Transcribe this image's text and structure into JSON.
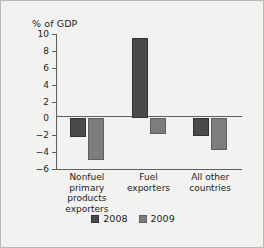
{
  "chart_data": {
    "type": "bar",
    "title": "",
    "subtitle": "",
    "xlabel": "",
    "ylabel": "% of GDP",
    "ylim": [
      -6,
      10
    ],
    "ytick_step": 2,
    "yticks": [
      10,
      8,
      6,
      4,
      2,
      0,
      "−2",
      "−4",
      "−6"
    ],
    "ytick_values": [
      10,
      8,
      6,
      4,
      2,
      0,
      -2,
      -4,
      -6
    ],
    "grid": false,
    "zero_line": true,
    "legend_position": "bottom-center",
    "categories": [
      "Nonfuel primary products exporters",
      "Fuel exporters",
      "All other countries"
    ],
    "category_lines": [
      [
        "Nonfuel primary",
        "products",
        "exporters"
      ],
      [
        "Fuel",
        "exporters"
      ],
      [
        "All other",
        "countries"
      ]
    ],
    "series": [
      {
        "name": "2008",
        "color": "#4a4a4a",
        "values": [
          -2.2,
          9.5,
          -2.1
        ]
      },
      {
        "name": "2009",
        "color": "#7d7d7d",
        "values": [
          -4.9,
          -1.8,
          -3.8
        ]
      }
    ]
  },
  "legend": {
    "entries": [
      {
        "label": "2008",
        "color": "#4a4a4a"
      },
      {
        "label": "2009",
        "color": "#7d7d7d"
      }
    ]
  },
  "colors": {
    "background": "#f2f2f0",
    "border": "#b9b9b6",
    "axis": "#5d5d5d",
    "text": "#1d1d1d",
    "series_2008": "#4a4a4a",
    "series_2009": "#7d7d7d"
  }
}
